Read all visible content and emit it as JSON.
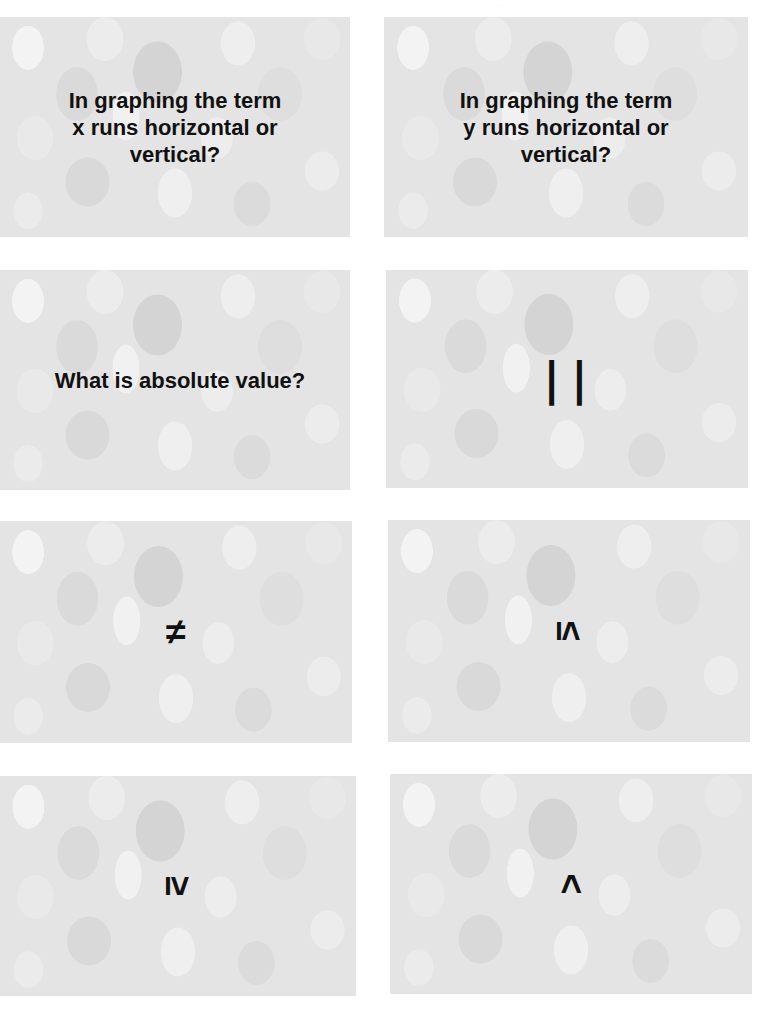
{
  "page": {
    "header_note": "· · · · ·"
  },
  "cards": [
    {
      "type": "question",
      "text": "In graphing the term\nx runs horizontal or\nvertical?"
    },
    {
      "type": "question",
      "text": "In graphing the term\ny runs horizontal or\nvertical?"
    },
    {
      "type": "question",
      "text": "What is absolute value?"
    },
    {
      "type": "symbol",
      "text": "| |",
      "meaning": "absolute value bars"
    },
    {
      "type": "symbol",
      "text": "≠",
      "meaning": "not equal to"
    },
    {
      "type": "symbol",
      "text": "≤",
      "meaning": "less than or equal to",
      "rotated": true
    },
    {
      "type": "symbol",
      "text": "≥",
      "meaning": "greater than or equal to",
      "rotated": true
    },
    {
      "type": "symbol",
      "text": "<",
      "meaning": "less than",
      "rotated": true
    }
  ],
  "colors": {
    "card_base": "#e4e4e4",
    "text": "#111111",
    "page_background": "#ffffff"
  }
}
